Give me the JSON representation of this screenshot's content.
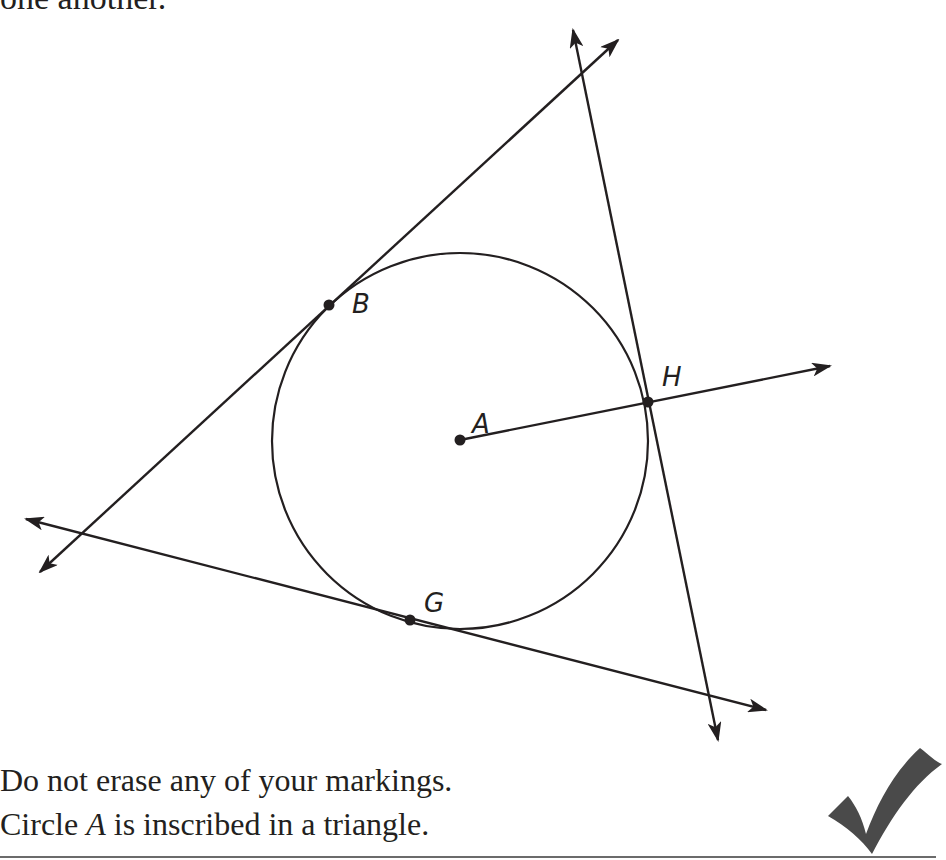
{
  "header": {
    "text_fragment": "one another."
  },
  "diagram": {
    "circle": {
      "name": "A",
      "cx": 460,
      "cy": 440,
      "r": 188
    },
    "points": [
      {
        "name": "A",
        "label": "A",
        "x": 460,
        "y": 440
      },
      {
        "name": "B",
        "label": "B",
        "x": 329,
        "y": 305
      },
      {
        "name": "H",
        "label": "H",
        "x": 648,
        "y": 402
      },
      {
        "name": "G",
        "label": "G",
        "x": 410,
        "y": 620
      }
    ],
    "lines": [
      {
        "name": "tangent-through-B",
        "from": [
          40,
          572
        ],
        "to": [
          618,
          40
        ]
      },
      {
        "name": "tangent-through-H",
        "from": [
          573,
          30
        ],
        "to": [
          718,
          740
        ]
      },
      {
        "name": "tangent-through-G",
        "from": [
          26,
          519
        ],
        "to": [
          766,
          710
        ]
      },
      {
        "name": "ray-A-through-H",
        "from": [
          460,
          440
        ],
        "to": [
          830,
          366
        ]
      }
    ],
    "stroke_color": "#231f20"
  },
  "notes": {
    "line1": "Do not erase any of your markings.",
    "line2_prefix": "Circle ",
    "line2_var": "A",
    "line2_suffix": " is inscribed in a triangle."
  },
  "checkmark": {
    "icon": "checkmark-icon",
    "color": "#4a4a4a"
  }
}
